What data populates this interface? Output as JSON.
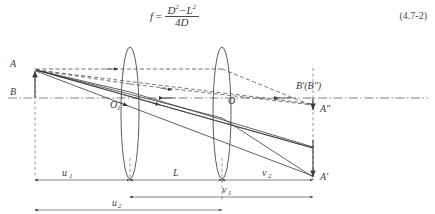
{
  "formula": {
    "lhs": "f",
    "equals": "=",
    "numerator_d": "D",
    "numerator_exp1": "2",
    "numerator_minus": "−",
    "numerator_l": "L",
    "numerator_exp2": "2",
    "denominator": "4D",
    "equation_number": "(4.7-2)"
  },
  "figure": {
    "points": {
      "object_top": "A",
      "object_base": "B",
      "lens1_center": "O",
      "lens1_center_sub": "1",
      "lens2_center": "O",
      "image_axis": "B'(B″)",
      "image_second": "A″",
      "image_first": "A'"
    },
    "dimensions": {
      "u1": "u",
      "u1_sub": "1",
      "L": "L",
      "v2": "v",
      "v2_sub": "2",
      "v1": "v",
      "v1_sub": "1",
      "u2": "u",
      "u2_sub": "2"
    }
  },
  "colors": {
    "ink": "#3a3a3a",
    "line": "#4a4a4a",
    "background": "#ffffff"
  }
}
